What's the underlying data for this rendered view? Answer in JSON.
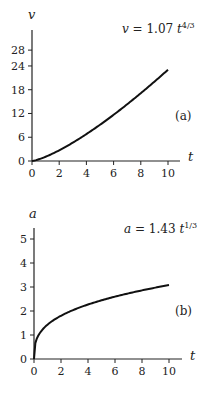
{
  "chart_data": [
    {
      "type": "line",
      "panel_label": "(a)",
      "title": "",
      "equation": {
        "lhs": "v",
        "eq": " = 1.07 ",
        "var": "t",
        "exp": "4/3"
      },
      "xlabel": "t",
      "ylabel": "v",
      "xlim": [
        0,
        10.8
      ],
      "ylim": [
        0,
        28
      ],
      "xticks": [
        0,
        2,
        4,
        6,
        8,
        10
      ],
      "yticks": [
        0,
        6,
        12,
        18,
        24,
        28
      ],
      "grid": false,
      "legend": "none",
      "series": [
        {
          "name": "v = 1.07 t^(4/3)",
          "coefficient": 1.07,
          "exponent": 1.3333,
          "x": [
            0,
            1,
            2,
            3,
            4,
            5,
            6,
            7,
            8,
            9,
            10
          ],
          "y": [
            0,
            1.07,
            2.7,
            4.63,
            6.79,
            9.15,
            11.66,
            14.33,
            17.12,
            20.03,
            23.05
          ]
        }
      ]
    },
    {
      "type": "line",
      "panel_label": "(b)",
      "title": "",
      "equation": {
        "lhs": "a",
        "eq": " = 1.43 ",
        "var": "t",
        "exp": "1/3"
      },
      "xlabel": "t",
      "ylabel": "a",
      "xlim": [
        0,
        10.8
      ],
      "ylim": [
        0,
        5.5
      ],
      "xticks": [
        0,
        2,
        4,
        6,
        8,
        10
      ],
      "yticks": [
        0,
        1,
        2,
        3,
        4,
        5
      ],
      "grid": false,
      "legend": "none",
      "series": [
        {
          "name": "a = 1.43 t^(1/3)",
          "coefficient": 1.43,
          "exponent": 0.3333,
          "x": [
            0,
            1,
            2,
            3,
            4,
            5,
            6,
            7,
            8,
            9,
            10
          ],
          "y": [
            0,
            1.43,
            1.8,
            2.06,
            2.27,
            2.45,
            2.6,
            2.74,
            2.86,
            2.97,
            3.08
          ]
        }
      ]
    }
  ]
}
